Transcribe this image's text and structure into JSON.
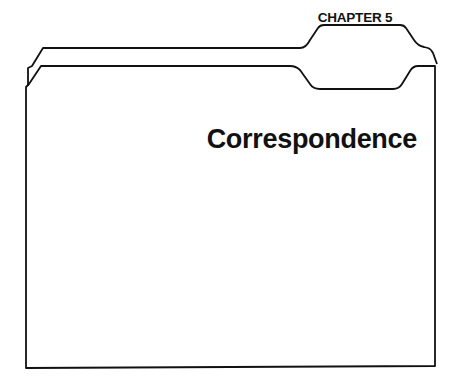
{
  "folder": {
    "tab_label": "CHAPTER 5",
    "title": "Correspondence",
    "stroke_color": "#111111",
    "background": "#ffffff"
  }
}
